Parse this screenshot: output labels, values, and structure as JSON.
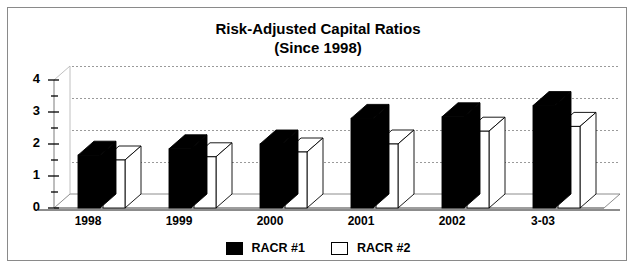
{
  "chart_data": {
    "type": "bar",
    "title": "Risk-Adjusted Capital Ratios",
    "subtitle": "(Since 1998)",
    "xlabel": "",
    "ylabel": "",
    "categories": [
      "1998",
      "1999",
      "2000",
      "2001",
      "2002",
      "3-03"
    ],
    "series": [
      {
        "name": "RACR #1",
        "color": "#000000",
        "values": [
          1.65,
          1.85,
          2.0,
          2.8,
          2.85,
          3.2
        ]
      },
      {
        "name": "RACR #2",
        "color": "#ffffff",
        "values": [
          1.5,
          1.6,
          1.75,
          2.0,
          2.4,
          2.55
        ]
      }
    ],
    "ylim": [
      0,
      4
    ],
    "yticks": [
      0,
      1,
      2,
      3,
      4
    ],
    "ytick_labels": [
      "0",
      "1",
      "2",
      "3",
      "4"
    ],
    "minor_ticks": [
      0.5,
      1.5,
      2.5,
      3.5
    ],
    "grid": true,
    "grid_style": "dotted",
    "legend_position": "bottom",
    "style": "3d-bar",
    "border": "#8a8a8a"
  },
  "legend": {
    "items": [
      {
        "label": "RACR #1",
        "swatch": "black-swatch"
      },
      {
        "label": "RACR #2",
        "swatch": "white-swatch"
      }
    ]
  }
}
